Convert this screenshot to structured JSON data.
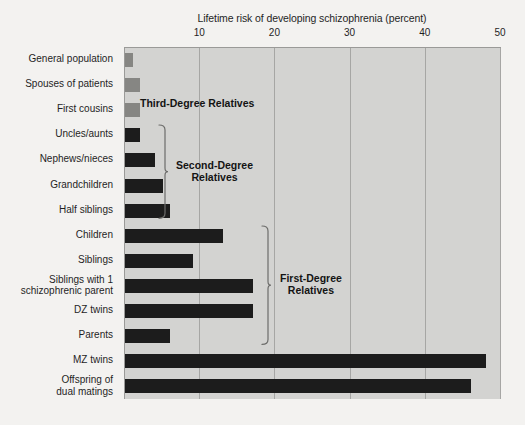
{
  "chart_data": {
    "type": "bar",
    "orientation": "horizontal",
    "title": "Lifetime risk of developing schizophrenia (percent)",
    "xlabel": "Lifetime risk of developing schizophrenia (percent)",
    "ylabel": "",
    "xlim": [
      0,
      50
    ],
    "xticks": [
      10,
      20,
      30,
      40,
      50
    ],
    "xtick_labels": [
      "10",
      "20",
      "30",
      "40",
      "50"
    ],
    "grid": true,
    "legend": "none",
    "categories": [
      "General population",
      "Spouses of patients",
      "First cousins",
      "Uncles/aunts",
      "Nephews/nieces",
      "Grandchildren",
      "Half siblings",
      "Children",
      "Siblings",
      "Siblings with 1\nschizophrenic parent",
      "DZ twins",
      "Parents",
      "MZ twins",
      "Offspring of\ndual matings"
    ],
    "values": [
      1,
      2,
      2,
      2,
      4,
      5,
      6,
      13,
      9,
      17,
      17,
      6,
      48,
      46
    ],
    "bar_colors": [
      "#868683",
      "#868683",
      "#868683",
      "#1c1c1c",
      "#1c1c1c",
      "#1c1c1c",
      "#1c1c1c",
      "#1c1c1c",
      "#1c1c1c",
      "#1c1c1c",
      "#1c1c1c",
      "#1c1c1c",
      "#1c1c1c",
      "#1c1c1c"
    ],
    "annotations": [
      {
        "text": "Third-Degree Relatives",
        "covers": [
          "General population",
          "Spouses of patients",
          "First cousins"
        ]
      },
      {
        "text": "Second-Degree\nRelatives",
        "covers": [
          "Uncles/aunts",
          "Nephews/nieces",
          "Grandchildren",
          "Half siblings"
        ]
      },
      {
        "text": "First-Degree\nRelatives",
        "covers": [
          "Children",
          "Siblings",
          "Siblings with 1 schizophrenic parent",
          "DZ twins",
          "Parents"
        ]
      }
    ],
    "colors": {
      "plot_background": "#d3d3d1",
      "page_background": "#f3f2f0",
      "gridline": "#a6a6a4",
      "light_bar": "#868683",
      "dark_bar": "#1c1c1c",
      "text": "#1f1f1f"
    }
  },
  "ticks": [
    {
      "label": "10",
      "value": 10
    },
    {
      "label": "20",
      "value": 20
    },
    {
      "label": "30",
      "value": 30
    },
    {
      "label": "40",
      "value": 40
    },
    {
      "label": "50",
      "value": 50
    }
  ],
  "rows": [
    {
      "label": "General population",
      "label_line2": "",
      "value": 1,
      "tone": "light"
    },
    {
      "label": "Spouses of patients",
      "label_line2": "",
      "value": 2,
      "tone": "light"
    },
    {
      "label": "First cousins",
      "label_line2": "",
      "value": 2,
      "tone": "light"
    },
    {
      "label": "Uncles/aunts",
      "label_line2": "",
      "value": 2,
      "tone": "dark"
    },
    {
      "label": "Nephews/nieces",
      "label_line2": "",
      "value": 4,
      "tone": "dark"
    },
    {
      "label": "Grandchildren",
      "label_line2": "",
      "value": 5,
      "tone": "dark"
    },
    {
      "label": "Half siblings",
      "label_line2": "",
      "value": 6,
      "tone": "dark"
    },
    {
      "label": "Children",
      "label_line2": "",
      "value": 13,
      "tone": "dark"
    },
    {
      "label": "Siblings",
      "label_line2": "",
      "value": 9,
      "tone": "dark"
    },
    {
      "label": "Siblings with 1",
      "label_line2": "schizophrenic parent",
      "value": 17,
      "tone": "dark"
    },
    {
      "label": "DZ twins",
      "label_line2": "",
      "value": 17,
      "tone": "dark"
    },
    {
      "label": "Parents",
      "label_line2": "",
      "value": 6,
      "tone": "dark"
    },
    {
      "label": "MZ twins",
      "label_line2": "",
      "value": 48,
      "tone": "dark"
    },
    {
      "label": "Offspring of",
      "label_line2": "dual matings",
      "value": 46,
      "tone": "dark"
    }
  ],
  "groups": {
    "third": {
      "line1": "Third-Degree Relatives",
      "line2": ""
    },
    "second": {
      "line1": "Second-Degree",
      "line2": "Relatives"
    },
    "first": {
      "line1": "First-Degree",
      "line2": "Relatives"
    }
  }
}
